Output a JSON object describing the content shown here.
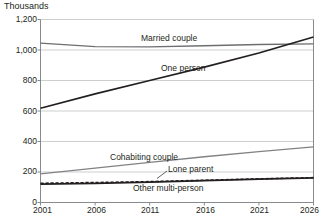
{
  "chart_data": {
    "type": "line",
    "title": "",
    "subtitle": "",
    "unit_label": "Thousands",
    "xlabel": "",
    "ylabel": "",
    "xlim": [
      2001,
      2026
    ],
    "ylim": [
      0,
      1200
    ],
    "grid": true,
    "legend_position": "inline-labels",
    "x_ticks": [
      "2001",
      "2006",
      "2011",
      "2016",
      "2021",
      "2026"
    ],
    "y_ticks": [
      "0",
      "200",
      "400",
      "600",
      "800",
      "1,000",
      "1,200"
    ],
    "x": [
      2001,
      2006,
      2011,
      2016,
      2021,
      2026
    ],
    "series": [
      {
        "name": "Married couple",
        "color": "#6d6e71",
        "style": "solid",
        "values": [
          1045,
          1022,
          1020,
          1028,
          1036,
          1040
        ]
      },
      {
        "name": "One person",
        "color": "#231f20",
        "style": "solid",
        "values": [
          618,
          712,
          800,
          888,
          980,
          1085
        ]
      },
      {
        "name": "Cohabiting couple",
        "color": "#808285",
        "style": "solid",
        "values": [
          188,
          225,
          263,
          300,
          333,
          365
        ]
      },
      {
        "name": "Lone parent",
        "color": "#231f20",
        "style": "dashed",
        "values": [
          126,
          131,
          137,
          146,
          155,
          163
        ]
      },
      {
        "name": "Other multi-person",
        "color": "#231f20",
        "style": "solid",
        "values": [
          120,
          126,
          133,
          143,
          153,
          162
        ]
      }
    ],
    "annotations": [
      {
        "text": "Married couple",
        "x": 2011.6,
        "y": 1100
      },
      {
        "text": "One person",
        "x": 2010.6,
        "y": 845
      },
      {
        "text": "Cohabiting couple",
        "x": 2007.2,
        "y": 300
      },
      {
        "text": "Lone parent",
        "x": 2013.4,
        "y": 212
      },
      {
        "text": "Other multi-person",
        "x": 2010.4,
        "y": 58
      }
    ]
  }
}
